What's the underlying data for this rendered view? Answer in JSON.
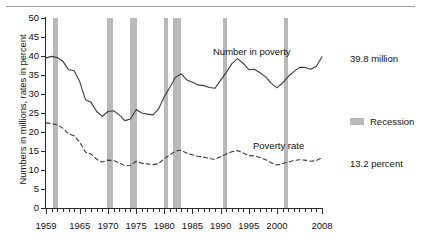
{
  "chart_data": {
    "type": "line",
    "title": "",
    "subtitle": "",
    "xlabel": "",
    "ylabel": "Numbers in millions, rates in percent",
    "xlim": [
      1959,
      2008
    ],
    "ylim": [
      0,
      50
    ],
    "y_ticks": [
      0,
      5,
      10,
      15,
      20,
      25,
      30,
      35,
      40,
      45,
      50
    ],
    "x_ticks": [
      1959,
      1965,
      1970,
      1975,
      1980,
      1985,
      1990,
      1995,
      2000,
      2008
    ],
    "x_tick_labels": [
      "1959",
      "1965",
      "1970",
      "1975",
      "1980",
      "1985",
      "1990",
      "1995",
      "2000",
      "2008"
    ],
    "grid": false,
    "legend_position": "right",
    "minor_tick_interval": 1,
    "series": [
      {
        "name": "Number in poverty",
        "style": "solid",
        "color": "#3b3b3b",
        "unit": "millions",
        "end_label": "39.8 million",
        "x": [
          1959,
          1960,
          1961,
          1962,
          1963,
          1964,
          1965,
          1966,
          1967,
          1968,
          1969,
          1970,
          1971,
          1972,
          1973,
          1974,
          1975,
          1976,
          1977,
          1978,
          1979,
          1980,
          1981,
          1982,
          1983,
          1984,
          1985,
          1986,
          1987,
          1988,
          1989,
          1990,
          1991,
          1992,
          1993,
          1994,
          1995,
          1996,
          1997,
          1998,
          1999,
          2000,
          2001,
          2002,
          2003,
          2004,
          2005,
          2006,
          2007,
          2008
        ],
        "values": [
          39.5,
          39.9,
          39.6,
          38.6,
          36.4,
          36.1,
          33.2,
          28.5,
          27.8,
          25.4,
          24.1,
          25.4,
          25.6,
          24.5,
          23.0,
          23.4,
          25.9,
          25.0,
          24.7,
          24.5,
          26.1,
          29.3,
          31.8,
          34.4,
          35.3,
          33.7,
          33.1,
          32.4,
          32.2,
          31.7,
          31.5,
          33.6,
          35.7,
          38.0,
          39.3,
          38.1,
          36.4,
          36.5,
          35.6,
          34.5,
          32.8,
          31.6,
          32.9,
          34.6,
          35.9,
          37.0,
          37.0,
          36.5,
          37.3,
          39.8
        ]
      },
      {
        "name": "Poverty rate",
        "style": "dashed",
        "color": "#3b3b3b",
        "unit": "percent",
        "end_label": "13.2 percent",
        "x": [
          1959,
          1960,
          1961,
          1962,
          1963,
          1964,
          1965,
          1966,
          1967,
          1968,
          1969,
          1970,
          1971,
          1972,
          1973,
          1974,
          1975,
          1976,
          1977,
          1978,
          1979,
          1980,
          1981,
          1982,
          1983,
          1984,
          1985,
          1986,
          1987,
          1988,
          1989,
          1990,
          1991,
          1992,
          1993,
          1994,
          1995,
          1996,
          1997,
          1998,
          1999,
          2000,
          2001,
          2002,
          2003,
          2004,
          2005,
          2006,
          2007,
          2008
        ],
        "values": [
          22.4,
          22.2,
          21.9,
          21.0,
          19.5,
          19.0,
          17.3,
          14.7,
          14.2,
          12.8,
          12.1,
          12.6,
          12.5,
          11.9,
          11.1,
          11.2,
          12.3,
          11.8,
          11.6,
          11.4,
          11.7,
          13.0,
          14.0,
          15.0,
          15.2,
          14.4,
          14.0,
          13.6,
          13.4,
          13.0,
          12.8,
          13.5,
          14.2,
          14.8,
          15.1,
          14.5,
          13.8,
          13.7,
          13.3,
          12.7,
          11.9,
          11.3,
          11.7,
          12.1,
          12.5,
          12.7,
          12.6,
          12.3,
          12.5,
          13.2
        ]
      }
    ],
    "recessions": [
      {
        "start": 1960.3,
        "end": 1961.2
      },
      {
        "start": 1969.9,
        "end": 1970.9
      },
      {
        "start": 1973.9,
        "end": 1975.2
      },
      {
        "start": 1980.0,
        "end": 1980.6
      },
      {
        "start": 1981.5,
        "end": 1982.9
      },
      {
        "start": 1990.5,
        "end": 1991.2
      },
      {
        "start": 2001.2,
        "end": 2001.9
      }
    ],
    "annotations": [
      {
        "name": "number-in-poverty",
        "text": "Number in poverty"
      },
      {
        "name": "poverty-rate",
        "text": "Poverty rate"
      }
    ],
    "legend": [
      {
        "name": "recession",
        "label": "Recession",
        "color": "#b9b9b9",
        "swatch": "band"
      }
    ]
  }
}
